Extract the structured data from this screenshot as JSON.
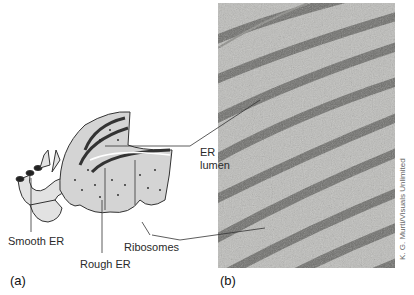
{
  "figure": {
    "panel_a": {
      "label": "(a)",
      "labels": {
        "smooth_er": "Smooth ER",
        "rough_er": "Rough ER",
        "ribosomes": "Ribosomes",
        "er_lumen_line1": "ER",
        "er_lumen_line2": "lumen"
      }
    },
    "panel_b": {
      "label": "(b)",
      "description": "Electron micrograph of rough endoplasmic reticulum"
    },
    "credit": "K. G. Murti/Visuals Unlimited",
    "colors": {
      "micrograph_bg": "#b9b9b6",
      "micrograph_dark": "#5d5d5a",
      "diagram_fill": "#d8d8d8",
      "diagram_stroke": "#333333"
    }
  }
}
